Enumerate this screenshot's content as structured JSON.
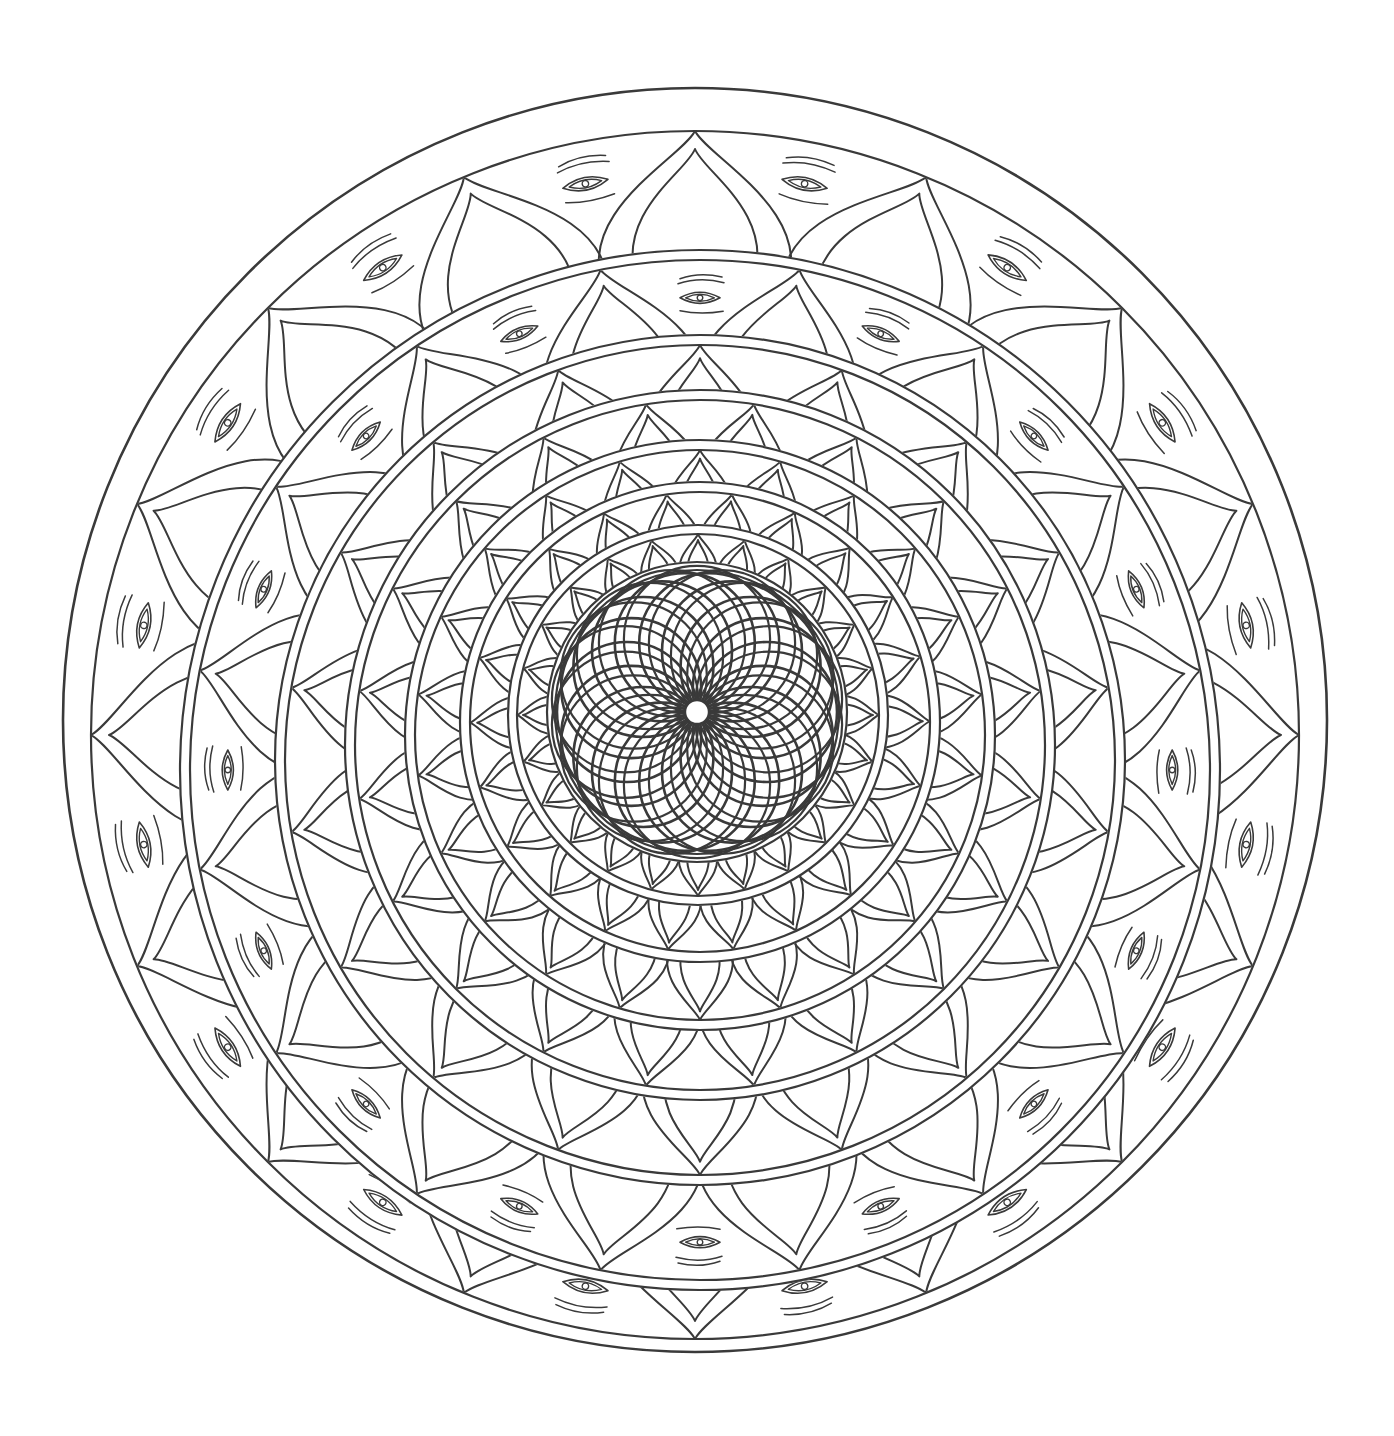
{
  "page": {
    "title": "",
    "width": 1394,
    "height": 1436,
    "background": "#ffffff",
    "ink": "#3a3a3a"
  },
  "mandala": {
    "center": [
      695,
      720
    ],
    "outer_border": {
      "radius": 632,
      "inner_radius": 604,
      "stroke": 2.6
    },
    "rings": [
      {
        "name": "band-1-outer",
        "cx": 695,
        "cy": 735,
        "r": 604,
        "gap": 0,
        "petals": 16,
        "petal_depth": 150,
        "eyes": true,
        "eye_size": 46,
        "rot": 0
      },
      {
        "name": "band-2",
        "cx": 700,
        "cy": 770,
        "r": 520,
        "gap": 10,
        "petals": 16,
        "petal_depth": 135,
        "eyes": true,
        "eye_size": 40,
        "rot": 11.25
      },
      {
        "name": "band-3",
        "cx": 700,
        "cy": 760,
        "r": 425,
        "gap": 10,
        "petals": 18,
        "petal_depth": 110,
        "eyes": false,
        "rot": 0
      },
      {
        "name": "band-4",
        "cx": 700,
        "cy": 745,
        "r": 355,
        "gap": 10,
        "petals": 20,
        "petal_depth": 90,
        "eyes": false,
        "rot": 9
      },
      {
        "name": "band-5",
        "cx": 700,
        "cy": 735,
        "r": 295,
        "gap": 10,
        "petals": 22,
        "petal_depth": 72,
        "eyes": false,
        "rot": 0
      },
      {
        "name": "band-6",
        "cx": 700,
        "cy": 722,
        "r": 240,
        "gap": 10,
        "petals": 22,
        "petal_depth": 60,
        "eyes": false,
        "rot": 8
      },
      {
        "name": "band-7",
        "cx": 698,
        "cy": 715,
        "r": 190,
        "gap": 9,
        "petals": 24,
        "petal_depth": 45,
        "eyes": false,
        "rot": 0
      },
      {
        "name": "band-8-inner",
        "cx": 697,
        "cy": 712,
        "r": 150,
        "gap": 8,
        "petals": 0,
        "petal_depth": 0,
        "eyes": false,
        "rot": 0
      }
    ],
    "rosette": {
      "cx": 697,
      "cy": 712,
      "count": 18,
      "circle_radius": 70,
      "hub_radius": 12,
      "stroke": 2.6
    }
  },
  "motifs": {
    "petal": "double-outlined lotus petal",
    "eye": "stylized eye with brow lines"
  }
}
